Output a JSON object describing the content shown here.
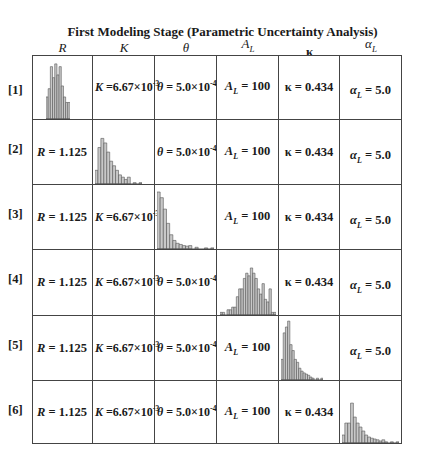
{
  "title": "First Modeling Stage (Parametric Uncertainty Analysis)",
  "columns": [
    {
      "symbol": "R",
      "sub": ""
    },
    {
      "symbol": "K",
      "sub": ""
    },
    {
      "symbol": "θ",
      "sub": ""
    },
    {
      "symbol": "A",
      "sub": "L"
    },
    {
      "symbol": "κ",
      "sub": ""
    },
    {
      "symbol": "α",
      "sub": "L"
    }
  ],
  "values": {
    "R": {
      "sym": "R",
      "sub": "",
      "text": " = 1.125",
      "exp": ""
    },
    "K": {
      "sym": "K",
      "sub": "",
      "text": " =6.67×10",
      "exp": "-3"
    },
    "theta": {
      "sym": "θ",
      "sub": "",
      "text": " = 5.0×10",
      "exp": "-4"
    },
    "AL": {
      "sym": "A",
      "sub": "L",
      "text": " = 100",
      "exp": ""
    },
    "kappa": {
      "sym": "κ",
      "sub": "",
      "text": " = 0.434",
      "exp": ""
    },
    "alphaL": {
      "sym": "α",
      "sub": "L",
      "text": " = 5.0",
      "exp": ""
    }
  },
  "rows": [
    {
      "label": "[1]",
      "varied": 0
    },
    {
      "label": "[2]",
      "varied": 1
    },
    {
      "label": "[3]",
      "varied": 2
    },
    {
      "label": "[4]",
      "varied": 3
    },
    {
      "label": "[5]",
      "varied": 4
    },
    {
      "label": "[6]",
      "varied": 5
    }
  ],
  "histograms": {
    "R": [
      40,
      55,
      95,
      75,
      100,
      80,
      95,
      60,
      40,
      30,
      30
    ],
    "K": [
      30,
      80,
      100,
      90,
      70,
      50,
      40,
      30,
      20,
      15,
      10,
      15,
      0,
      3,
      0,
      3
    ],
    "theta": [
      100,
      90,
      70,
      45,
      25,
      15,
      10,
      8,
      6,
      5,
      6,
      0,
      3,
      0,
      0,
      2,
      0,
      2
    ],
    "AL": [
      5,
      5,
      0,
      10,
      10,
      15,
      15,
      35,
      50,
      50,
      70,
      80,
      75,
      90,
      80,
      70,
      50,
      40,
      60,
      30,
      25,
      50,
      5,
      5
    ],
    "kappa": [
      35,
      80,
      90,
      100,
      60,
      50,
      35,
      30,
      20,
      15,
      12,
      10,
      8,
      5,
      3,
      0,
      3,
      0,
      3
    ],
    "alphaL": [
      20,
      50,
      50,
      100,
      65,
      50,
      40,
      30,
      20,
      15,
      12,
      10,
      8,
      5,
      8,
      3,
      0,
      3,
      0,
      3
    ]
  },
  "colors": {
    "bar_fill": "#c8c8c8",
    "bar_stroke": "#555555",
    "grid": "#444444"
  }
}
